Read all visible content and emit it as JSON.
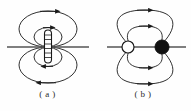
{
  "figure": {
    "kind": "physics-field-line-diagram",
    "background_color": "#fefefe",
    "stroke_color": "#1a1a1a",
    "axis_color": "#555555",
    "width": 191,
    "height": 111,
    "panels": [
      {
        "id": "a",
        "caption": "( a )",
        "title_label": "a",
        "center": {
          "x": 48,
          "y": 47
        },
        "axis": {
          "x1": 7,
          "x2": 89,
          "y": 47,
          "label": "horizontal-axis-line"
        },
        "source": {
          "type": "solenoid-rod",
          "shape": "vertical-capsule",
          "x": 48,
          "y_top": 30,
          "y_bottom": 63,
          "width": 7,
          "fill": "#ffffff",
          "coil_turns": 6
        },
        "loops": [
          {
            "name": "outer-loop-top",
            "rx": 29,
            "ry": 18,
            "cy": 29,
            "arrow": "right",
            "arrow_at": "top"
          },
          {
            "name": "inner-loop-top",
            "rx": 14,
            "ry": 9,
            "cy": 37,
            "arrow": "right",
            "arrow_at": "top"
          },
          {
            "name": "outer-loop-bottom",
            "rx": 29,
            "ry": 18,
            "cy": 65,
            "arrow": "left",
            "arrow_at": "bottom"
          },
          {
            "name": "inner-loop-bottom",
            "rx": 14,
            "ry": 9,
            "cy": 57,
            "arrow": "left",
            "arrow_at": "bottom"
          }
        ]
      },
      {
        "id": "b",
        "caption": "( b )",
        "title_label": "b",
        "center": {
          "x": 48,
          "y": 47
        },
        "axis": {
          "x1": 12,
          "x2": 91,
          "y": 47,
          "label": "horizontal-axis-line"
        },
        "poles": [
          {
            "name": "open-pole",
            "role": "source-monopole",
            "x": 33,
            "y": 47,
            "r": 6,
            "fill": "#ffffff",
            "stroke": "#1a1a1a"
          },
          {
            "name": "filled-pole",
            "role": "sink-monopole",
            "x": 67,
            "y": 47,
            "r": 7,
            "fill": "#111111",
            "stroke": "#111111"
          }
        ],
        "loops": [
          {
            "name": "outer-arc-top",
            "arrow": "right",
            "arrow_at": "top",
            "height": 33
          },
          {
            "name": "inner-arc-top",
            "arrow": "right",
            "arrow_at": "top",
            "height": 17
          },
          {
            "name": "outer-arc-bottom",
            "arrow": "right",
            "arrow_at": "bottom",
            "height": 33
          },
          {
            "name": "inner-arc-bottom",
            "arrow": "right",
            "arrow_at": "bottom",
            "height": 17
          }
        ]
      }
    ]
  }
}
